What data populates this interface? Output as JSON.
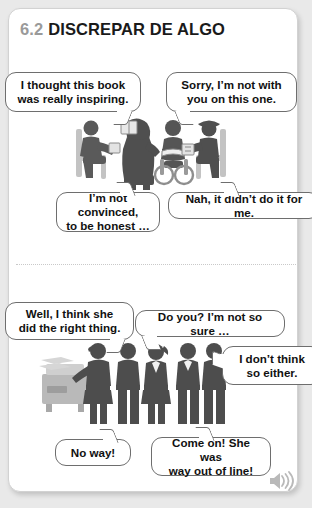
{
  "header": {
    "section_number": "6.2",
    "title": "DISCREPAR DE ALGO"
  },
  "scene_one": {
    "name": "book-club-discussion",
    "bubbles": [
      {
        "id": "b1",
        "line1": "I thought this book",
        "line2": "was really inspiring."
      },
      {
        "id": "b2",
        "line1": "Sorry, I’m not with",
        "line2": "you on this one."
      },
      {
        "id": "b3",
        "line1": "I’m not convinced,",
        "line2": "to be honest …"
      },
      {
        "id": "b4",
        "line1": "Nah, it didn’t do it for me.",
        "line2": ""
      }
    ]
  },
  "scene_two": {
    "name": "office-copier-conversation",
    "bubbles": [
      {
        "id": "b5",
        "line1": "Well, I think she",
        "line2": "did the right thing."
      },
      {
        "id": "b6",
        "line1": "Do you? I’m not so sure …",
        "line2": ""
      },
      {
        "id": "b7",
        "line1": "I don’t think",
        "line2": "so either."
      },
      {
        "id": "b8",
        "line1": "No way!",
        "line2": ""
      },
      {
        "id": "b9",
        "line1": "Come on! She was",
        "line2": "way out of line!"
      }
    ]
  },
  "footer": {
    "audio_icon": "speaker-icon"
  },
  "colors": {
    "page_background": "#e9e9e9",
    "card_background": "#ffffff",
    "card_border": "#d2d2d2",
    "section_number": "#9a9a9a",
    "title_text": "#1a1a1a",
    "bubble_border": "#6e6e6e",
    "divider": "#c9c9c9",
    "figure_dark": "#4d4d4d",
    "figure_mid": "#7a7a7a",
    "figure_light": "#b4b4b4",
    "speaker_icon": "#b9b9b9"
  }
}
